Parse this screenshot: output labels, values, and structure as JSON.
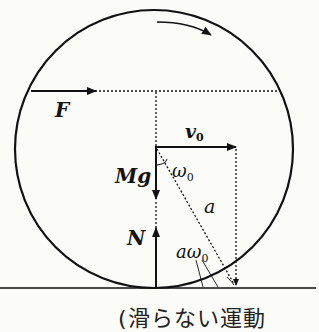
{
  "diagram": {
    "labels": {
      "force": "F",
      "velocity": "v",
      "velocity_sub": "0",
      "weight": "Mg",
      "angular_velocity": "ω",
      "angular_velocity_sub": "0",
      "radius": "a",
      "normal": "N",
      "tangential_speed": "aω",
      "tangential_speed_sub": "0"
    },
    "caption": "(滑らない運動",
    "colors": {
      "stroke": "#111111",
      "background": "#fbfbf8"
    }
  }
}
